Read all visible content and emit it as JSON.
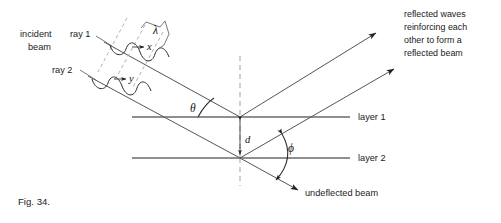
{
  "figure": {
    "caption": "Fig. 34."
  },
  "labels": {
    "incident_beam_line1": "incident",
    "incident_beam_line2": "beam",
    "ray1": "ray 1",
    "ray2": "ray 2",
    "wavelength": "λ",
    "point_x": "x",
    "point_y": "y",
    "theta": "θ",
    "phi": "ϕ",
    "spacing": "d",
    "layer1": "layer 1",
    "layer2": "layer 2",
    "undeflected_beam": "undeflected beam",
    "reflected_note_line1": "reflected waves",
    "reflected_note_line2": "reinforcing each",
    "reflected_note_line3": "other to form a",
    "reflected_note_line4": "reflected beam"
  },
  "geometry": {
    "layer1_y": 117,
    "layer2_y": 158,
    "layer_x_start": 132,
    "layer_x_end": 350,
    "vertex1_x": 240,
    "vertex2_x": 240,
    "normal_x": 240,
    "normal_y_top": 56,
    "normal_y_bottom": 186,
    "spacing_d_label": "d",
    "incidence_angle_symbol": "θ",
    "deflection_angle_symbol": "ϕ"
  },
  "colors": {
    "background": "#ffffff",
    "ink": "#1a1a1a",
    "line": "#5a5a5a",
    "layer_line": "#6a6a6a",
    "dashed": "#9a9a9a",
    "arrow": "#222222"
  }
}
